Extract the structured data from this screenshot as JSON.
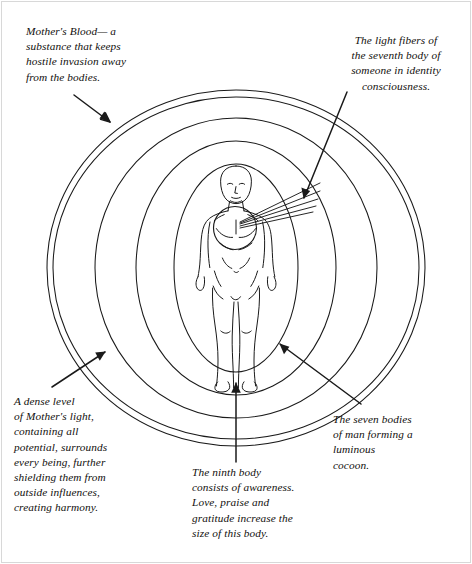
{
  "figure": {
    "title": "The seven bodies of man forming a luminous cocoon",
    "type": "aura-diagram",
    "colors": {
      "ink": "#12100e",
      "line": "#1a1a1a",
      "frame": "#d8d8d8",
      "background": "#ffffff"
    }
  },
  "captions": {
    "mothers_blood": "Mother's Blood— a\nsubstance that keeps\nhostile invasion away\nfrom the bodies.",
    "light_fibers": "The light fibers of\nthe seventh body of\nsomeone in identity\nconsciousness.",
    "dense_level": "A dense level\nof Mother's light,\n containing all\npotential, surrounds\nevery being, further\nshielding them from\noutside influences,\ncreating harmony.",
    "ninth_body": "The ninth body\nconsists of awareness.\nLove, praise and\ngratitude increase the\nsize of this body.",
    "seven_bodies": "The seven bodies\nof man forming a\nluminous\ncocoon."
  },
  "elements": {
    "central_figure": "standing-human-figure",
    "heart_center": "heart-circle",
    "fiber_count": 5,
    "ring_count": 6,
    "arrows": [
      "arrow-mothers-blood",
      "arrow-light-fibers",
      "arrow-dense-level",
      "arrow-ninth-body",
      "arrow-seven-bodies"
    ]
  }
}
